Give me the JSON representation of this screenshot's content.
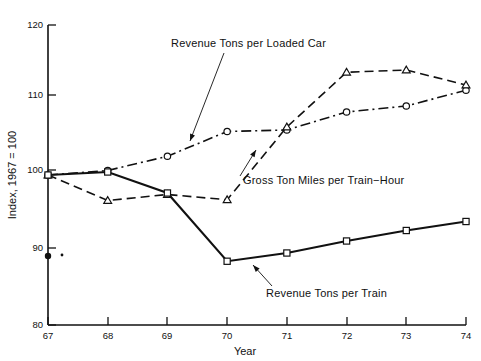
{
  "chart_data": {
    "type": "line",
    "title": "",
    "xlabel": "Year",
    "ylabel": "Index, 1967 = 100",
    "x": [
      67,
      68,
      69,
      70,
      71,
      72,
      73,
      74
    ],
    "xtick_labels": [
      "67",
      "68",
      "69",
      "70",
      "71",
      "72",
      "73",
      "74"
    ],
    "xlim": [
      67,
      74
    ],
    "ylim": [
      80,
      120
    ],
    "ytick_labels": [
      "80",
      "90",
      "100",
      "110",
      "120"
    ],
    "yticks": [
      80,
      90,
      100,
      110,
      120
    ],
    "grid": false,
    "legend": "annotations-with-leader-lines",
    "series": [
      {
        "name": "Revenue Tons per Loaded Car",
        "line_style": "dash-dot",
        "marker": "circle",
        "values": [
          100.0,
          100.6,
          102.5,
          105.8,
          106.0,
          108.4,
          109.2,
          111.3
        ]
      },
      {
        "name": "Gross Ton Miles per Train−Hour",
        "line_style": "dashed",
        "marker": "triangle",
        "values": [
          100.0,
          96.6,
          97.4,
          96.7,
          106.4,
          113.7,
          114.0,
          112.0
        ]
      },
      {
        "name": "Revenue Tons per Train",
        "line_style": "solid",
        "marker": "square",
        "values": [
          100.0,
          100.4,
          97.6,
          88.5,
          89.6,
          91.2,
          92.6,
          93.8
        ]
      }
    ],
    "annotations": [
      {
        "label": "Revenue Tons per Loaded Car",
        "text_x": 171,
        "text_y": 47,
        "leader_from_x": 224,
        "leader_from_y": 53,
        "leader_to_x": 190,
        "leader_to_y": 141
      },
      {
        "label": "Gross Ton Miles per Train−Hour",
        "text_x": 243,
        "text_y": 184,
        "leader_from_x": 240,
        "leader_from_y": 176,
        "leader_to_x": 256,
        "leader_to_y": 150
      },
      {
        "label": "Revenue Tons per Train",
        "text_x": 266,
        "text_y": 297,
        "leader_from_x": 272,
        "leader_from_y": 286,
        "leader_to_x": 253,
        "leader_to_y": 265
      }
    ]
  }
}
